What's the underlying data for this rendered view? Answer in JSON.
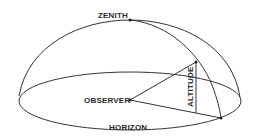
{
  "diagram": {
    "labels": {
      "zenith": "ZENITH",
      "observer": "OBSERVER",
      "altitude": "ALTITUDE",
      "horizon": "HORIZON"
    },
    "colors": {
      "line": "#333333",
      "text": "#2a2a2a",
      "background": "#ffffff"
    }
  }
}
